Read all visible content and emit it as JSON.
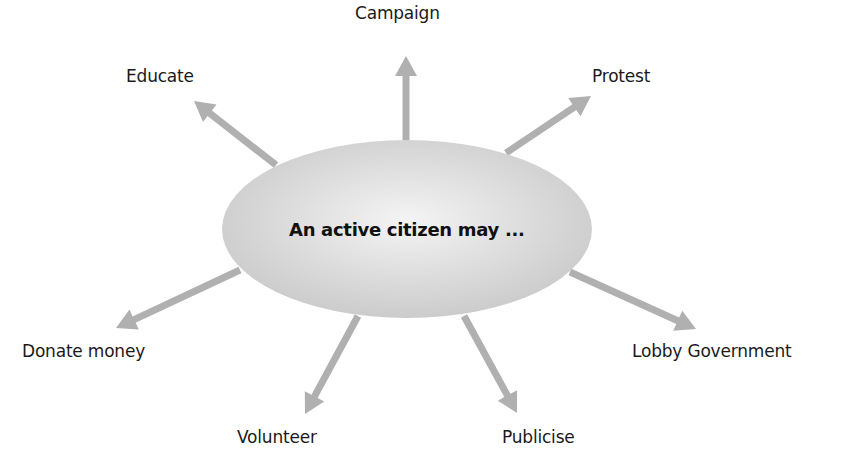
{
  "diagram": {
    "center": {
      "text": "An active citizen may ...",
      "cx": 407,
      "cy": 229,
      "rx": 185,
      "ry": 89,
      "fill_center": "#f4f4f4",
      "fill_edge": "#c8c8c8"
    },
    "arrow_color": "#b0b0b0",
    "nodes": [
      {
        "id": "campaign",
        "label": "Campaign",
        "from": [
          406,
          140
        ],
        "to": [
          406,
          56
        ],
        "lx": 355,
        "ly": 3
      },
      {
        "id": "educate",
        "label": "Educate",
        "from": [
          276,
          165
        ],
        "to": [
          194,
          101
        ],
        "lx": 126,
        "ly": 66
      },
      {
        "id": "protest",
        "label": "Protest",
        "from": [
          506,
          153
        ],
        "to": [
          591,
          96
        ],
        "lx": 592,
        "ly": 66
      },
      {
        "id": "donate-money",
        "label": "Donate money",
        "from": [
          240,
          270
        ],
        "to": [
          116,
          328
        ],
        "lx": 22,
        "ly": 341
      },
      {
        "id": "volunteer",
        "label": "Volunteer",
        "from": [
          358,
          316
        ],
        "to": [
          305,
          414
        ],
        "lx": 237,
        "ly": 427
      },
      {
        "id": "publicise",
        "label": "Publicise",
        "from": [
          464,
          316
        ],
        "to": [
          517,
          413
        ],
        "lx": 502,
        "ly": 427
      },
      {
        "id": "lobby-government",
        "label": "Lobby Government",
        "from": [
          570,
          272
        ],
        "to": [
          696,
          329
        ],
        "lx": 632,
        "ly": 341
      }
    ]
  }
}
